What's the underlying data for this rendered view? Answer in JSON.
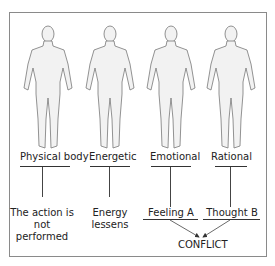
{
  "figures": [
    {
      "label": "Physical body",
      "result": "The action is not performed"
    },
    {
      "label": "Energetic",
      "result": "Energy lessens"
    },
    {
      "label": "Emotional",
      "result": "Feeling A"
    },
    {
      "label": "Rational",
      "result": "Thought B"
    }
  ],
  "labels": {
    "physical": "Physical body",
    "energetic": "Energetic",
    "emotional": "Emotional",
    "rational": "Rational"
  },
  "results": {
    "physical_line1": "The action is not",
    "physical_line2": "performed",
    "energetic_line1": "Energy",
    "energetic_line2": "lessens",
    "feeling": "Feeling A",
    "thought": "Thought B"
  },
  "outcome": "CONFLICT",
  "colors": {
    "frame": "#8a8a8a",
    "figure_fill": "#f2f2f2",
    "figure_stroke": "#777777",
    "text": "#222222"
  }
}
